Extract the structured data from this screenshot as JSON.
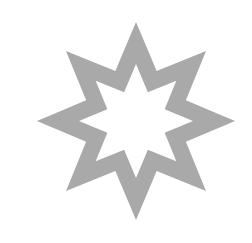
{
  "shape": {
    "type": "eight-pointed-star-outline",
    "points": 8,
    "center": [
      136,
      121
    ],
    "outer_tip_radius": 99,
    "outer_valley_radius": 54,
    "inner_tip_radius": 57,
    "inner_valley_radius": 31,
    "fill_color": "#a9a9a9",
    "background_color": "#ffffff"
  }
}
